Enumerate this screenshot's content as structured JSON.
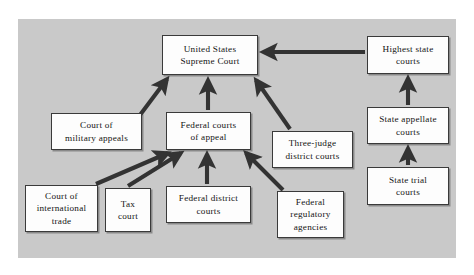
{
  "figure": {
    "panel_background": "#c9c9c9",
    "page_background": "#ffffff",
    "node_fill": "#fdfdfd",
    "node_border": "#3a3a3a",
    "arrow_color": "#333333"
  },
  "nodes": [
    {
      "id": "supreme-court",
      "label": "United States\nSupreme Court",
      "x": 144,
      "y": 16,
      "w": 96,
      "h": 40
    },
    {
      "id": "highest-state-courts",
      "label": "Highest state\ncourts",
      "x": 349,
      "y": 17,
      "w": 82,
      "h": 38
    },
    {
      "id": "court-of-military-appeals",
      "label": "Court of\nmilitary appeals",
      "x": 33,
      "y": 94,
      "w": 91,
      "h": 37
    },
    {
      "id": "federal-courts-of-appeal",
      "label": "Federal courts\nof appeal",
      "x": 148,
      "y": 93,
      "w": 85,
      "h": 38
    },
    {
      "id": "state-appellate-courts",
      "label": "State appellate\ncourts",
      "x": 349,
      "y": 88,
      "w": 82,
      "h": 37
    },
    {
      "id": "three-judge-district-courts",
      "label": "Three-judge\ndistrict courts",
      "x": 254,
      "y": 112,
      "w": 81,
      "h": 37
    },
    {
      "id": "state-trial-courts",
      "label": "State trial\ncourts",
      "x": 349,
      "y": 148,
      "w": 82,
      "h": 38
    },
    {
      "id": "court-of-international-trade",
      "label": "Court of\ninternational\ntrade",
      "x": 7,
      "y": 166,
      "w": 73,
      "h": 47
    },
    {
      "id": "tax-court",
      "label": "Tax\ncourt",
      "x": 87,
      "y": 169,
      "w": 46,
      "h": 44
    },
    {
      "id": "federal-district-courts",
      "label": "Federal district\ncourts",
      "x": 148,
      "y": 167,
      "w": 85,
      "h": 37
    },
    {
      "id": "federal-regulatory-agencies",
      "label": "Federal\nregulatory\nagencies",
      "x": 259,
      "y": 172,
      "w": 67,
      "h": 47
    }
  ],
  "edges": [
    {
      "id": "military-appeals-to-supreme",
      "from": "court-of-military-appeals",
      "to": "supreme-court",
      "style": "diagonal-up-right"
    },
    {
      "id": "federal-appeal-to-supreme",
      "from": "federal-courts-of-appeal",
      "to": "supreme-court",
      "style": "vertical-up"
    },
    {
      "id": "three-judge-to-supreme",
      "from": "three-judge-district-courts",
      "to": "supreme-court",
      "style": "diagonal-up-left"
    },
    {
      "id": "highest-state-to-supreme",
      "from": "highest-state-courts",
      "to": "supreme-court",
      "style": "horizontal-left"
    },
    {
      "id": "state-appellate-to-highest-state",
      "from": "state-appellate-courts",
      "to": "highest-state-courts",
      "style": "vertical-up"
    },
    {
      "id": "state-trial-to-state-appellate",
      "from": "state-trial-courts",
      "to": "state-appellate-courts",
      "style": "vertical-up"
    },
    {
      "id": "international-trade-to-federal-appeal",
      "from": "court-of-international-trade",
      "to": "federal-courts-of-appeal",
      "style": "diagonal-up-right"
    },
    {
      "id": "tax-court-to-federal-appeal",
      "from": "tax-court",
      "to": "federal-courts-of-appeal",
      "style": "diagonal-up-right"
    },
    {
      "id": "federal-district-to-federal-appeal",
      "from": "federal-district-courts",
      "to": "federal-courts-of-appeal",
      "style": "vertical-up"
    },
    {
      "id": "regulatory-agencies-to-federal-appeal",
      "from": "federal-regulatory-agencies",
      "to": "federal-courts-of-appeal",
      "style": "diagonal-up-left"
    }
  ]
}
